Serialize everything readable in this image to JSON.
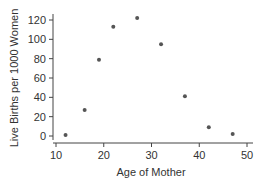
{
  "chart_data": {
    "type": "scatter",
    "title": "",
    "xlabel": "Age of Mother",
    "ylabel": "Live Births per 1000 Women",
    "xlim": [
      9,
      51
    ],
    "ylim": [
      -5,
      126
    ],
    "xticks": [
      10,
      20,
      30,
      40,
      50
    ],
    "yticks": [
      0,
      20,
      40,
      60,
      80,
      100,
      120
    ],
    "grid": false,
    "legend": null,
    "point_color": "#555555",
    "x": [
      12,
      16,
      19,
      22,
      27,
      32,
      37,
      42,
      47
    ],
    "y": [
      1,
      27,
      79,
      113,
      122,
      95,
      41,
      9,
      2
    ]
  }
}
